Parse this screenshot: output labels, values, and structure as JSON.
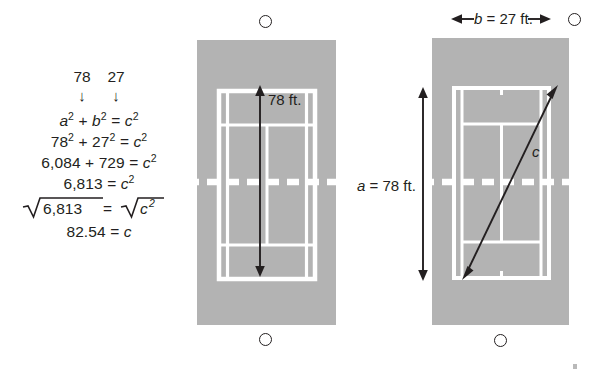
{
  "figure": {
    "colors": {
      "court_fill": "#b3b3b3",
      "court_line": "#ffffff",
      "ink": "#231f20",
      "page": "#ffffff"
    }
  },
  "work": {
    "given_values": [
      "78",
      "27"
    ],
    "arrow_glyph": "↓",
    "steps": [
      "a² + b² = c²",
      "78² + 27² = c²",
      "6,084 + 729 = c²",
      "6,813 = c²",
      "√6,813 = √c²",
      "82.54 = c"
    ],
    "step_parts": {
      "s1": {
        "lhs": "a",
        "op1": "+",
        "b": "b",
        "eq": "=",
        "c": "c"
      },
      "s2": {
        "lhs": "78",
        "op1": "+",
        "b": "27",
        "eq": "=",
        "c": "c"
      },
      "s3": {
        "lhs": "6,084",
        "op1": "+",
        "b": "729",
        "eq": "=",
        "c": "c"
      },
      "s4": {
        "lhs": "6,813",
        "eq": "=",
        "c": "c"
      },
      "s5": {
        "radicand": "6,813",
        "eq": "=",
        "c": "c"
      },
      "s6": {
        "lhs": "82.54",
        "eq": "=",
        "c": "c"
      }
    },
    "exponent": "2"
  },
  "court_left": {
    "name": "tennis-court-length",
    "dimension_label": "78 ft.",
    "ball_top": "tennis-ball-icon",
    "ball_bottom": "tennis-ball-icon",
    "arrow": "double-headed-vertical-arrow",
    "net": "net-dashed-line"
  },
  "court_right": {
    "name": "tennis-court-diagonal",
    "width_label": "b = 27 ft.",
    "width_label_var": "b",
    "width_label_rest": "= 27 ft.",
    "length_label": "a = 78 ft.",
    "length_label_var": "a",
    "length_label_rest": "= 78 ft.",
    "hypotenuse_label": "c",
    "ball_top": "tennis-ball-icon",
    "ball_bottom": "tennis-ball-icon",
    "arrow_width": "double-headed-horizontal-arrow",
    "arrow_length": "double-headed-vertical-arrow",
    "arrow_diagonal": "double-headed-diagonal-arrow",
    "net": "net-dashed-line"
  }
}
